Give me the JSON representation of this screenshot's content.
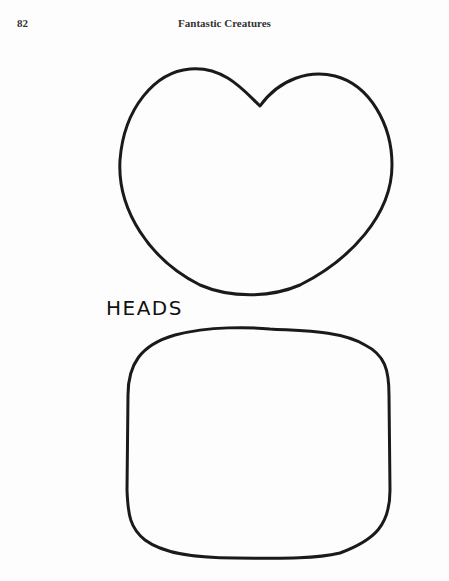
{
  "header": {
    "page_number": "82",
    "running_title": "Fantastic Creatures"
  },
  "figure": {
    "section_label": "HEADS",
    "shapes": [
      {
        "name": "heart-shaped-head-outline"
      },
      {
        "name": "rounded-square-head-outline"
      }
    ],
    "stroke_color": "#1a1a1a"
  }
}
